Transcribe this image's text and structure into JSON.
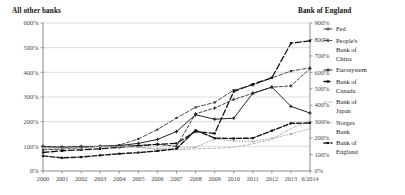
{
  "header": {
    "left_title": "All other banks",
    "right_title": "Bank of England"
  },
  "chart_data": {
    "type": "line",
    "title": "",
    "xlabel": "",
    "ylabel": "All other banks",
    "y2label": "Bank of England",
    "grid": true,
    "legend_position": "right",
    "x": [
      "2000",
      "2001",
      "2002",
      "2003",
      "2004",
      "2005",
      "2006",
      "2007",
      "2008",
      "2009",
      "2010",
      "2011",
      "2012",
      "2013",
      "6/2014"
    ],
    "categories": [
      "2000",
      "2001",
      "2002",
      "2003",
      "2004",
      "2005",
      "2006",
      "2007",
      "2008",
      "2009",
      "2010",
      "2011",
      "2012",
      "2013",
      "6/2014"
    ],
    "ylim": [
      0,
      600
    ],
    "y_ticks": [
      "0%",
      "100%",
      "200%",
      "300%",
      "400%",
      "500%",
      "600%"
    ],
    "y2lim": [
      0,
      900
    ],
    "y2_ticks": [
      "0%",
      "100%",
      "200%",
      "300%",
      "400%",
      "500%",
      "600%",
      "700%",
      "800%",
      "900%"
    ],
    "series": [
      {
        "name": "Fed",
        "axis": "left",
        "marker": "plus",
        "dash": "3,2",
        "color": "#2b2b2b",
        "width": 0.9,
        "values": [
          100,
          97,
          100,
          100,
          100,
          104,
          108,
          100,
          232,
          255,
          290,
          315,
          340,
          345,
          415
        ]
      },
      {
        "name": "People's Bank of China",
        "axis": "left",
        "marker": "square",
        "dash": "4,2",
        "color": "#3a3a3a",
        "width": 0.9,
        "values": [
          86,
          88,
          95,
          100,
          105,
          130,
          168,
          215,
          258,
          278,
          328,
          348,
          378,
          405,
          418
        ]
      },
      {
        "name": "Eurosystem",
        "axis": "left",
        "marker": "plus",
        "dash": "",
        "color": "#222222",
        "width": 1.0,
        "values": [
          98,
          96,
          98,
          100,
          103,
          112,
          128,
          160,
          228,
          210,
          214,
          315,
          340,
          262,
          235
        ]
      },
      {
        "name": "Bank of Canada",
        "axis": "left",
        "marker": "square",
        "dash": "6,2.5",
        "color": "#111111",
        "width": 1.3,
        "values": [
          75,
          82,
          86,
          90,
          96,
          102,
          108,
          112,
          160,
          152,
          322,
          352,
          378,
          518,
          528
        ]
      },
      {
        "name": "Bank of Japan",
        "axis": "left",
        "marker": "none",
        "dash": "3,2",
        "color": "#a8a8a8",
        "width": 0.8,
        "values": [
          92,
          93,
          96,
          100,
          100,
          98,
          86,
          86,
          90,
          92,
          96,
          110,
          128,
          172,
          205
        ]
      },
      {
        "name": "Norges Bank",
        "axis": "left",
        "marker": "dot",
        "dash": "1,2",
        "color": "#9a9a9a",
        "width": 0.9,
        "values": [
          95,
          92,
          90,
          100,
          98,
          96,
          92,
          92,
          96,
          130,
          122,
          120,
          132,
          150,
          172
        ]
      },
      {
        "name": "Bank of England",
        "axis": "right",
        "marker": "square",
        "dash": "5,2",
        "color": "#151515",
        "width": 1.4,
        "values": [
          92,
          80,
          85,
          95,
          105,
          112,
          122,
          135,
          248,
          200,
          198,
          200,
          245,
          290,
          292
        ]
      }
    ],
    "legend": [
      {
        "label": "Fed",
        "style": "dashed-plus"
      },
      {
        "label": "People's Bank of China",
        "style": "dashed-square"
      },
      {
        "label": "Eurosystem",
        "style": "solid-plus"
      },
      {
        "label": "Bank of Canada",
        "style": "dashed-bold-square"
      },
      {
        "label": "Bank of Japan",
        "style": "light-dashed"
      },
      {
        "label": "Norges Bank",
        "style": "light-dotted"
      },
      {
        "label": "Bank of England",
        "style": "solid-bold-square"
      }
    ]
  }
}
